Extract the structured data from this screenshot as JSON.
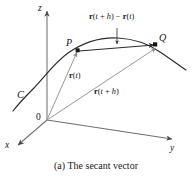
{
  "figure": {
    "caption": "(a) The secant vector",
    "axes": [
      {
        "name": "z-axis",
        "label": "z"
      },
      {
        "name": "y-axis",
        "label": "y"
      },
      {
        "name": "x-axis",
        "label": "x"
      }
    ],
    "origin_label": "0",
    "curve_label": "C",
    "points": [
      {
        "name": "point-p",
        "label": "P"
      },
      {
        "name": "point-q",
        "label": "Q"
      }
    ],
    "vectors": [
      {
        "name": "position-vector-t",
        "label_html": "<b>r</b>(<i>t</i>)",
        "label_text": "r(t)"
      },
      {
        "name": "position-vector-t-plus-h",
        "label_html": "<b>r</b>(<i>t</i> + <i>h</i>)",
        "label_text": "r(t + h)"
      },
      {
        "name": "secant-vector",
        "label_html": "<b>r</b>(<i>t</i> + <i>h</i>) &minus; <b>r</b>(<i>t</i>)",
        "label_text": "r(t + h) − r(t)"
      }
    ],
    "colors": {
      "ink": "#1a1a1a",
      "axis": "#6f6f6f",
      "curve": "#2b2b2b",
      "vector": "#8a8a8a",
      "secant": "#2b2b2b",
      "background": "#ffffff"
    }
  }
}
